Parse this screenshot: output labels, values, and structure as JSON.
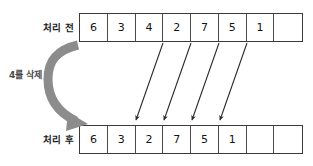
{
  "diagram": {
    "rows": [
      {
        "name": "before",
        "label": "처리 전",
        "cells": [
          "6",
          "3",
          "4",
          "2",
          "7",
          "5",
          "1",
          ""
        ]
      },
      {
        "name": "after",
        "label": "처리 후",
        "cells": [
          "6",
          "3",
          "2",
          "7",
          "5",
          "1",
          "",
          ""
        ]
      }
    ],
    "operation": {
      "caption": "4를 삭제",
      "curved_arrow_name": "delete-curved-arrow"
    },
    "shift_arrows": [
      {
        "from_index": 3,
        "to_index": 2,
        "value": "2"
      },
      {
        "from_index": 4,
        "to_index": 3,
        "value": "7"
      },
      {
        "from_index": 5,
        "to_index": 4,
        "value": "5"
      },
      {
        "from_index": 6,
        "to_index": 5,
        "value": "1"
      }
    ],
    "colors": {
      "background": "#ffffff",
      "border": "#3a3a3a",
      "cell_border": "#4a4a4a",
      "text": "#141414",
      "caption": "#4a4a4a",
      "curved_arrow": "#8c8c8c",
      "shift_arrow": "#2b2b2b"
    }
  }
}
